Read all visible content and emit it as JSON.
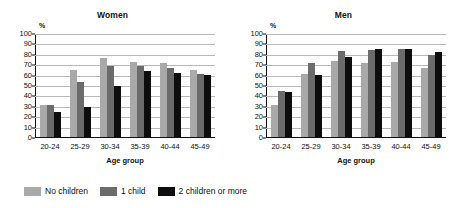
{
  "chart_data": [
    {
      "type": "bar",
      "title": "Women",
      "xlabel": "Age group",
      "ylabel": "%",
      "ylim": [
        0,
        100
      ],
      "ytick_step": 10,
      "grid": true,
      "legend_position": "bottom",
      "categories": [
        "20-24",
        "25-29",
        "30-34",
        "35-39",
        "40-44",
        "45-49"
      ],
      "series": [
        {
          "name": "No children",
          "color": "#a9a9a9",
          "values": [
            31,
            64,
            76,
            72,
            71,
            64
          ]
        },
        {
          "name": "1 child",
          "color": "#6b6b6b",
          "values": [
            31,
            53,
            68,
            68,
            66,
            61
          ]
        },
        {
          "name": "2 children or more",
          "color": "#0d0d0d",
          "values": [
            24,
            29,
            49,
            63,
            62,
            60
          ]
        }
      ]
    },
    {
      "type": "bar",
      "title": "Men",
      "xlabel": "Age group",
      "ylabel": "%",
      "ylim": [
        0,
        100
      ],
      "ytick_step": 10,
      "grid": true,
      "legend_position": "bottom",
      "categories": [
        "20-24",
        "25-29",
        "30-34",
        "35-39",
        "40-44",
        "45-49"
      ],
      "series": [
        {
          "name": "No children",
          "color": "#a9a9a9",
          "values": [
            31,
            61,
            73,
            71,
            72,
            66
          ]
        },
        {
          "name": "1 child",
          "color": "#6b6b6b",
          "values": [
            44,
            71,
            83,
            84,
            85,
            79
          ]
        },
        {
          "name": "2 children or more",
          "color": "#0d0d0d",
          "values": [
            43,
            60,
            77,
            85,
            85,
            82
          ]
        }
      ]
    }
  ],
  "yticks": [
    "100",
    "90",
    "80",
    "70",
    "60",
    "50",
    "40",
    "30",
    "20",
    "10",
    "0"
  ],
  "legend": {
    "items": [
      {
        "label": "No children",
        "color": "#a9a9a9"
      },
      {
        "label": "1 child",
        "color": "#6b6b6b"
      },
      {
        "label": "2 children or more",
        "color": "#0d0d0d"
      }
    ]
  }
}
